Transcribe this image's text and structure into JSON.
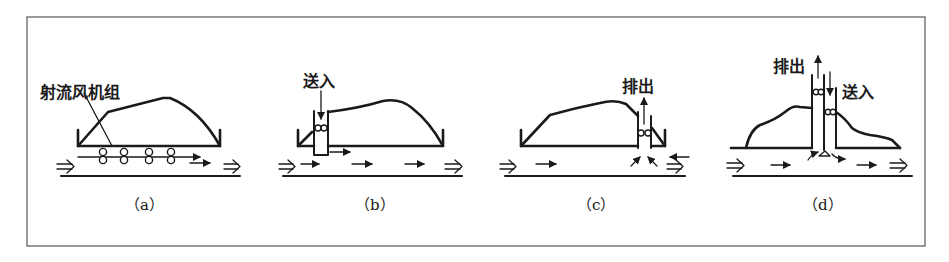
{
  "figure": {
    "type": "diagram",
    "panels": [
      {
        "id": "a",
        "caption": "（a）",
        "label": "射流风机组",
        "label_meaning": "jet fan group",
        "fan_count": 4
      },
      {
        "id": "b",
        "caption": "（b）",
        "label": "送入",
        "label_meaning": "supply in"
      },
      {
        "id": "c",
        "caption": "（c）",
        "label": "排出",
        "label_meaning": "exhaust out"
      },
      {
        "id": "d",
        "caption": "（d）",
        "labels": [
          "排出",
          "送入"
        ],
        "label_meaning": [
          "exhaust out",
          "supply in"
        ]
      }
    ]
  },
  "colors": {
    "line": "#1a1a1a",
    "frame": "#555555",
    "background": "#ffffff"
  }
}
